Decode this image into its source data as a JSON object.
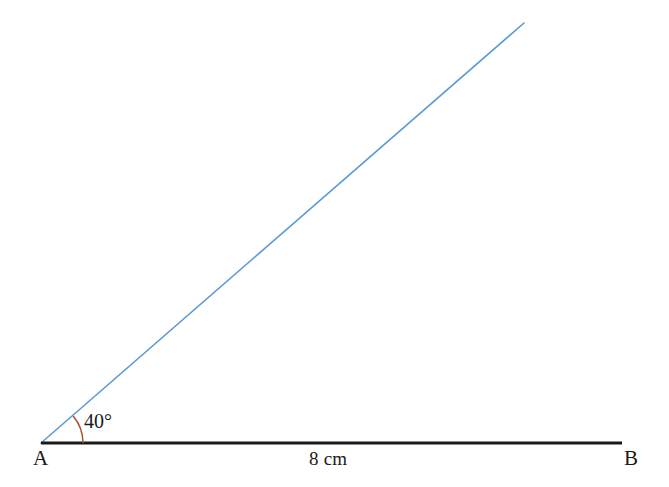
{
  "figure": {
    "background_color": "#ffffff",
    "vertex_label": "A",
    "endpoint_label": "B",
    "angle_label": "40°",
    "length_label": "8 cm",
    "baseline_color": "#1a1a1a",
    "ray_color": "#5b9bd5",
    "arc_color": "#a8522e",
    "label_color": "#1a1a1a"
  },
  "chart_data": {
    "type": "diagram",
    "points": [
      {
        "name": "A",
        "label": "A",
        "x": 41,
        "y": 443
      },
      {
        "name": "B",
        "label": "B",
        "x": 622,
        "y": 443
      },
      {
        "name": "C",
        "label": "",
        "x": 524,
        "y": 23
      }
    ],
    "segments": [
      {
        "name": "base-line-AB",
        "from": "A",
        "to": "B",
        "color": "#1a1a1a",
        "width": 3,
        "label": "8 cm"
      },
      {
        "name": "ray-AC",
        "from": "A",
        "to": "C",
        "color": "#5b9bd5",
        "width": 1.6,
        "label": ""
      }
    ],
    "angles": [
      {
        "name": "angle-at-A",
        "vertex": "A",
        "value": 40,
        "unit": "degrees",
        "label": "40°",
        "arc_radius": 42,
        "arc_color": "#a8522e"
      }
    ],
    "measurements": [
      {
        "name": "AB",
        "value": 8,
        "unit": "cm",
        "label": "8 cm"
      }
    ]
  }
}
